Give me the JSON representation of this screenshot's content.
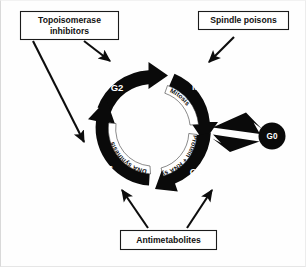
{
  "figure": {
    "background_color": "#fefefe",
    "ink_color": "#0a0a0a"
  },
  "callouts": [
    {
      "id": "topoisomerase-inhibitors",
      "label_line1": "Topoisomerase",
      "label_line2": "inhibitors",
      "targets": [
        "G2",
        "S"
      ]
    },
    {
      "id": "spindle-poisons",
      "label_line1": "Spindle poisons",
      "label_line2": "",
      "targets": [
        "M"
      ]
    },
    {
      "id": "antimetabolites",
      "label_line1": "Antimetabolites",
      "label_line2": "",
      "targets": [
        "S",
        "G1"
      ]
    }
  ],
  "cycle": {
    "phases": [
      {
        "id": "M",
        "letter": "M",
        "band_label": "Mitosis"
      },
      {
        "id": "G1",
        "letter": "G1",
        "band_label": "Protein + RNA synthesis"
      },
      {
        "id": "S",
        "letter": "S",
        "band_label": "DNA synthesis"
      },
      {
        "id": "G2",
        "letter": "G2",
        "band_label": ""
      }
    ],
    "resting_state": {
      "id": "G0",
      "letter": "G0"
    },
    "direction": "clockwise"
  }
}
